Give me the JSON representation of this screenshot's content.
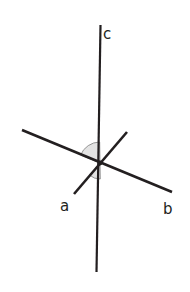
{
  "figure": {
    "background_color": "#ffffff",
    "stroke_color": "#231f20",
    "angle_fill_color": "#e3e3e3",
    "angle_stroke_color": "#8a8a8a",
    "width": 190,
    "height": 292,
    "vertex": {
      "x": 100,
      "y": 163
    }
  },
  "labels": {
    "c": {
      "text": "c",
      "x": 103,
      "y": 39
    },
    "a": {
      "text": "a",
      "x": 60,
      "y": 211
    },
    "b": {
      "text": "b",
      "x": 163,
      "y": 214
    }
  },
  "lines": [
    {
      "name": "line-c-vertical",
      "label": "c",
      "x1": 100.5,
      "y1": 25,
      "x2": 96.5,
      "y2": 272,
      "width": 2.2
    },
    {
      "name": "line-b-shallow",
      "label": "b",
      "x1": 22,
      "y1": 130,
      "x2": 172,
      "y2": 192,
      "width": 2.6
    },
    {
      "name": "line-a-steep",
      "label": "a",
      "x1": 74,
      "y1": 194,
      "x2": 127,
      "y2": 132,
      "width": 2.6
    }
  ],
  "angles": [
    {
      "name": "upper-left-angle-arc",
      "radius": 21,
      "start_deg": 157.5,
      "end_deg": 90.9,
      "description": "sector between ray toward b-line upper-left and ray c upward"
    },
    {
      "name": "lower-left-angle-arc",
      "radius": 16,
      "start_deg": 229.5,
      "end_deg": 270.9,
      "description": "sector between ray toward a lower-left and ray c downward"
    }
  ]
}
